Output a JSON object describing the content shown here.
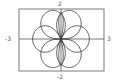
{
  "chart_data": {
    "type": "line",
    "subtype": "polar-rose",
    "title": "",
    "xlabel": "",
    "ylabel": "",
    "xlim": [
      -3,
      3
    ],
    "ylim": [
      -2,
      2
    ],
    "tick_labels": {
      "x_min": "-3",
      "x_max": "3",
      "y_min": "-2",
      "y_max": "2"
    },
    "grid": false,
    "petals": {
      "count": 6,
      "angles_deg": [
        0,
        60,
        120,
        180,
        240,
        300
      ],
      "approx_length": 2
    },
    "inner_loops": {
      "axis": "vertical",
      "approx_length": 1.7
    },
    "colors": {
      "curve": "#3a3a3a",
      "axes": "#555555",
      "frame": "#7a7a7a",
      "background": "#ffffff"
    }
  }
}
